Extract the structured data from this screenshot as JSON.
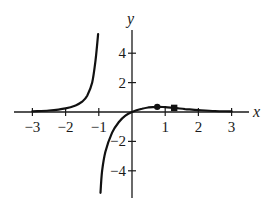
{
  "chart_data": {
    "type": "line",
    "title": "",
    "xlabel": "x",
    "ylabel": "y",
    "xlim": [
      -3.5,
      3.5
    ],
    "ylim": [
      -5.8,
      5.8
    ],
    "grid": false,
    "legend": null,
    "x_ticks": [
      -3,
      -2,
      -1,
      1,
      2,
      3
    ],
    "x_tick_labels": [
      "−3",
      "−2",
      "−1",
      "1",
      "2",
      "3"
    ],
    "y_ticks": [
      4,
      2,
      -2,
      -4
    ],
    "y_tick_labels": [
      "4",
      "2",
      "−2",
      "−4"
    ],
    "vertical_asymptote": -1,
    "series": [
      {
        "name": "left-branch",
        "x": [
          -3.0,
          -2.5,
          -2.0,
          -1.7,
          -1.5,
          -1.35,
          -1.2,
          -1.1,
          -1.02
        ],
        "y": [
          0.05,
          0.1,
          0.25,
          0.45,
          0.7,
          1.1,
          2.0,
          3.5,
          5.3
        ]
      },
      {
        "name": "right-branch",
        "x": [
          -0.95,
          -0.9,
          -0.8,
          -0.6,
          -0.4,
          -0.2,
          0.0,
          0.3,
          0.5,
          0.76,
          1.0,
          1.27,
          1.6,
          2.0,
          2.5,
          3.0
        ],
        "y": [
          -5.5,
          -4.0,
          -2.7,
          -1.4,
          -0.7,
          -0.25,
          0.0,
          0.22,
          0.31,
          0.35,
          0.33,
          0.28,
          0.2,
          0.13,
          0.07,
          0.04
        ]
      }
    ],
    "markers": [
      {
        "shape": "circle",
        "x": 0.76,
        "y": 0.35
      },
      {
        "shape": "square",
        "x": 1.27,
        "y": 0.28
      }
    ]
  },
  "labels": {
    "x_axis": "x",
    "y_axis": "y"
  }
}
